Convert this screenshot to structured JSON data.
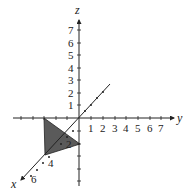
{
  "diagram": {
    "type": "3d-coordinate-axes",
    "axes": {
      "x": {
        "label": "x",
        "tick_labels": [
          "2",
          "4",
          "6"
        ]
      },
      "y": {
        "label": "y",
        "tick_labels": [
          "1",
          "2",
          "3",
          "4",
          "5",
          "6",
          "7"
        ]
      },
      "z": {
        "label": "z",
        "tick_labels": [
          "1",
          "2",
          "3",
          "4",
          "5",
          "6",
          "7"
        ]
      }
    },
    "shaded_triangle": {
      "description": "Shaded triangular region with vertices on the axes",
      "fill": "#5a5a5a"
    },
    "colors": {
      "axis": "#222222",
      "shade": "#5a5a5a",
      "background": "#ffffff"
    }
  }
}
